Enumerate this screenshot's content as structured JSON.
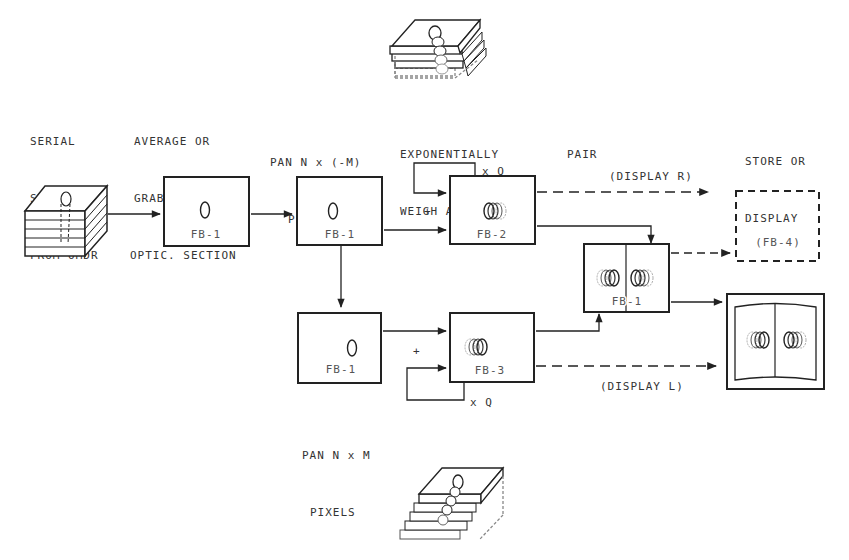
{
  "stage_labels": {
    "serial_section": [
      "SERIAL",
      "SECTION",
      "FROM OMDR"
    ],
    "average_grab": [
      "AVERAGE OR",
      "GRAB NEXT",
      "OPTIC. SECTION"
    ],
    "pan_neg": [
      "PAN N x (-M)",
      "PIXELS"
    ],
    "exp_weigh": [
      "EXPONENTIALLY",
      "WEIGH AND SUM"
    ],
    "pair": [
      "PAIR"
    ],
    "store_display": [
      "STORE OR",
      "DISPLAY"
    ],
    "pan_pos": [
      "PAN N x M",
      "PIXELS"
    ]
  },
  "boxes": {
    "avg_fb": "FB-1",
    "pan_neg_fb": "FB-1",
    "pan_pos_fb": "FB-1",
    "sum_r_fb": "FB-2",
    "sum_l_fb": "FB-3",
    "pair_fb": "FB-1",
    "store_fb": "(FB-4)"
  },
  "annotations": {
    "feedback_top": "x Q",
    "feedback_bottom": "x Q",
    "display_r": "(DISPLAY R)",
    "display_l": "(DISPLAY L)",
    "plus_top": "+",
    "plus_bottom": "+"
  }
}
